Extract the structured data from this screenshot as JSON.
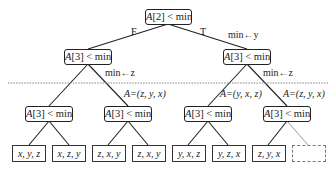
{
  "root": {
    "label": "A[2] < min",
    "var": "A",
    "idx": "[2]",
    "cmp": " < min"
  },
  "edges": {
    "root_left": "F",
    "root_right": "T",
    "root_right_action": "min←y",
    "l2_left_right_action": "min←z",
    "l2_right_right_action": "min←z",
    "l3_2_assign": "A=(z, y, x)",
    "l3_3_assign": "A=(y, x, z)",
    "l3_4_assign": "A=(z, y, x)"
  },
  "level2": [
    {
      "var": "A",
      "idx": "[3]",
      "cmp": " < min"
    },
    {
      "var": "A",
      "idx": "[3]",
      "cmp": " < min"
    }
  ],
  "level3": [
    {
      "var": "A",
      "idx": "[3]",
      "cmp": " < min"
    },
    {
      "var": "A",
      "idx": "[3]",
      "cmp": " < min"
    },
    {
      "var": "A",
      "idx": "[3]",
      "cmp": " < min"
    },
    {
      "var": "A",
      "idx": "[3]",
      "cmp": " < min"
    }
  ],
  "leaves": [
    {
      "label": "x, y, z"
    },
    {
      "label": "x, z, y"
    },
    {
      "label": "z, x, y"
    },
    {
      "label": "z, x, y"
    },
    {
      "label": "y, x, z"
    },
    {
      "label": "y, z, x"
    },
    {
      "label": "z, y, x"
    },
    {
      "label": ""
    }
  ],
  "colors": {
    "line": "#222222",
    "dashed_separator": "#888888",
    "empty_leaf_border": "#777777"
  }
}
